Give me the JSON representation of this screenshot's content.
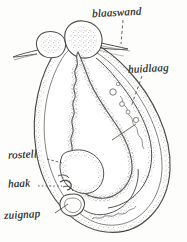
{
  "figure": {
    "style": "pen-and-ink scientific illustration, grayscale",
    "background_color": "#fdfdfc",
    "ink_color": "#4a4a47",
    "labels": [
      {
        "id": "blaaswand",
        "text": "blaaswand",
        "leader": "vertical-dashed"
      },
      {
        "id": "huidlaag",
        "text": "huidlaag",
        "leader": "diagonal-dashed"
      },
      {
        "id": "rostell",
        "text": "rostell",
        "leader": "short-dash"
      },
      {
        "id": "haak",
        "text": "haak",
        "leader": "horizontal-dotted"
      },
      {
        "id": "zuignap",
        "text": "zuignap",
        "leader": "diagonal-line"
      }
    ]
  }
}
